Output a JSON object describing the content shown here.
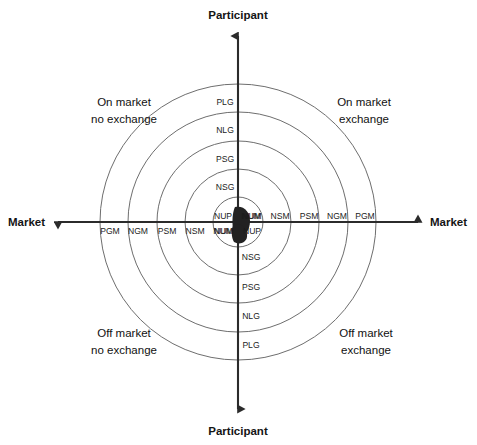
{
  "figure": {
    "type": "concentric-quadrant-diagram",
    "axes": {
      "vertical": {
        "top_label": "Participant",
        "bottom_label": "Participant"
      },
      "horizontal": {
        "left_label": "Market",
        "right_label": "Market"
      }
    },
    "quadrants": [
      {
        "position": "top-left",
        "line1": "On market",
        "line2": "no exchange"
      },
      {
        "position": "top-right",
        "line1": "On market",
        "line2": "exchange"
      },
      {
        "position": "bottom-left",
        "line1": "Off market",
        "line2": "no exchange"
      },
      {
        "position": "bottom-right",
        "line1": "Off market",
        "line2": "exchange"
      }
    ],
    "rings": [
      {
        "index": 1,
        "radius_px": 25
      },
      {
        "index": 2,
        "radius_px": 53
      },
      {
        "index": 3,
        "radius_px": 81
      },
      {
        "index": 4,
        "radius_px": 110
      },
      {
        "index": 5,
        "radius_px": 138
      }
    ],
    "ring_labels": {
      "upper_vertical_outward": [
        "NSG",
        "PSG",
        "NLG",
        "PLG"
      ],
      "lower_vertical_outward": [
        "NSG",
        "PSG",
        "NLG",
        "PLG"
      ],
      "upper_axis_right_outward": [
        "NUM",
        "NSM",
        "PSM",
        "NGM",
        "PGM"
      ],
      "lower_axis_left_outward": [
        "NUM",
        "NSM",
        "PSM",
        "NGM",
        "PGM"
      ],
      "inner_upper_left": "NUP",
      "inner_lower_right": "NUP",
      "inner_lower_left": "NUM",
      "inner_upper_right": "NUM"
    },
    "colors": {
      "ring_stroke": "#6e6e6e",
      "axis_stroke": "#2b2b2b",
      "text": "#1a1a1a",
      "background": "#ffffff"
    }
  }
}
